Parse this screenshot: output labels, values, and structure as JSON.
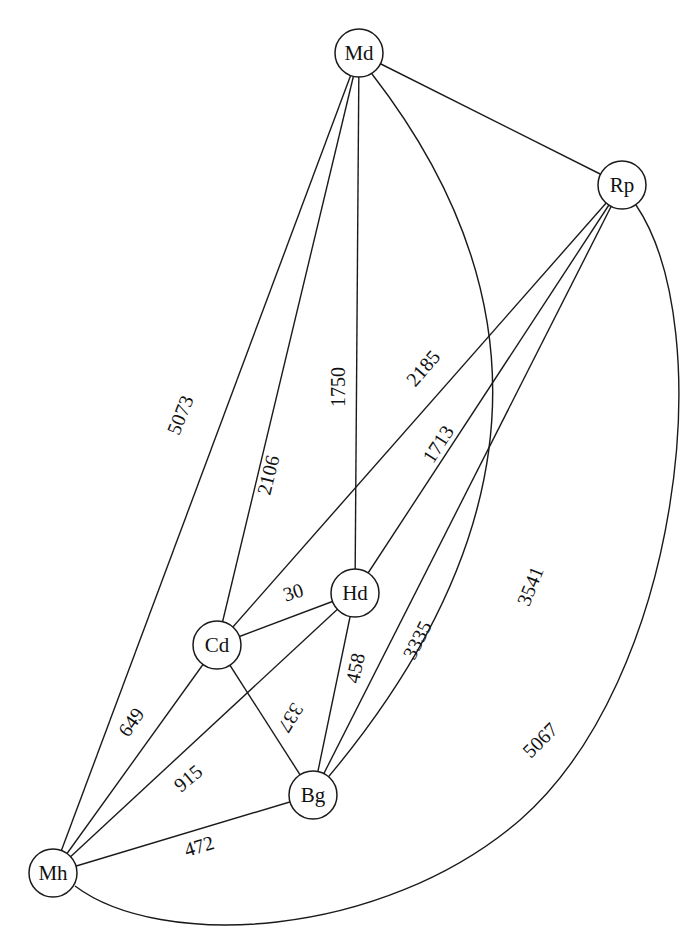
{
  "diagram": {
    "type": "weighted-undirected-graph",
    "nodes": [
      {
        "id": "Md",
        "label": "Md",
        "x": 359,
        "y": 53
      },
      {
        "id": "Rp",
        "label": "Rp",
        "x": 622,
        "y": 185
      },
      {
        "id": "Hd",
        "label": "Hd",
        "x": 355,
        "y": 593
      },
      {
        "id": "Cd",
        "label": "Cd",
        "x": 217,
        "y": 645
      },
      {
        "id": "Bg",
        "label": "Bg",
        "x": 313,
        "y": 795
      },
      {
        "id": "Mh",
        "label": "Mh",
        "x": 53,
        "y": 873
      }
    ],
    "edges": [
      {
        "from": "Md",
        "to": "Rp",
        "weight": ""
      },
      {
        "from": "Md",
        "to": "Mh",
        "weight": "5073"
      },
      {
        "from": "Md",
        "to": "Cd",
        "weight": "2106"
      },
      {
        "from": "Md",
        "to": "Hd",
        "weight": "1750"
      },
      {
        "from": "Md",
        "to": "Bg",
        "weight": "3541"
      },
      {
        "from": "Rp",
        "to": "Cd",
        "weight": "2185"
      },
      {
        "from": "Rp",
        "to": "Hd",
        "weight": "1713"
      },
      {
        "from": "Rp",
        "to": "Bg",
        "weight": "3335"
      },
      {
        "from": "Rp",
        "to": "Mh",
        "weight": "5067"
      },
      {
        "from": "Cd",
        "to": "Hd",
        "weight": "30"
      },
      {
        "from": "Cd",
        "to": "Bg",
        "weight": "337"
      },
      {
        "from": "Cd",
        "to": "Mh",
        "weight": "649"
      },
      {
        "from": "Hd",
        "to": "Bg",
        "weight": "458"
      },
      {
        "from": "Hd",
        "to": "Mh",
        "weight": "915"
      },
      {
        "from": "Bg",
        "to": "Mh",
        "weight": "472"
      }
    ]
  },
  "labels": {
    "md": "Md",
    "rp": "Rp",
    "hd": "Hd",
    "cd": "Cd",
    "bg": "Bg",
    "mh": "Mh",
    "e_md_mh": "5073",
    "e_md_cd": "2106",
    "e_md_hd": "1750",
    "e_md_bg": "3541",
    "e_rp_cd": "2185",
    "e_rp_hd": "1713",
    "e_rp_bg": "3335",
    "e_rp_mh": "5067",
    "e_cd_hd": "30",
    "e_cd_bg": "337",
    "e_cd_mh": "649",
    "e_hd_bg": "458",
    "e_hd_mh": "915",
    "e_bg_mh": "472"
  }
}
